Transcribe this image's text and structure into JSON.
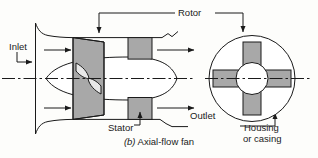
{
  "figure": {
    "caption_marker": "(b)",
    "caption_text": " Axial-flow fan"
  },
  "labels": {
    "rotor": "Rotor",
    "inlet": "Inlet",
    "stator": "Stator",
    "outlet": "Outlet",
    "housing": "Housing",
    "casing": "or casing"
  },
  "colors": {
    "line": "#1a1a1a",
    "fill_gray": "#a8a8a8",
    "fill_white": "#ffffff",
    "background": "#fdfdfb"
  },
  "parts": {
    "rotor_shape": "hexagonal-barrel-blade-ring",
    "stator_shape": "rectangular-vane-block",
    "hub_shape": "ogive-pointed-ellipse",
    "blade_shape": "twisted-propeller-bowtie",
    "housing_shape": "bellmouth-duct",
    "end_view_shape": "circle-with-four-blades"
  },
  "end_view": {
    "blade_count": 4,
    "hub": "center-circle"
  }
}
